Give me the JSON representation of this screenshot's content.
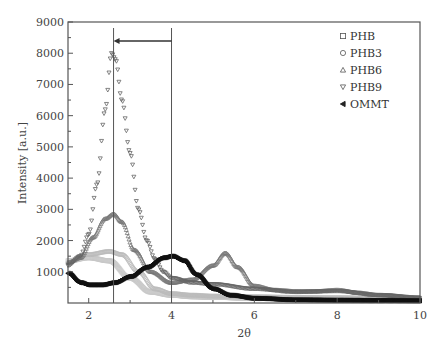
{
  "chart_data": {
    "type": "scatter",
    "title": "",
    "xlabel": "2θ",
    "ylabel": "Intensity [a.u.]",
    "xlim": [
      1.5,
      10
    ],
    "ylim": [
      0,
      9000
    ],
    "xticks": [
      2,
      4,
      6,
      8,
      10
    ],
    "yticks": [
      1000,
      2000,
      3000,
      4000,
      5000,
      6000,
      7000,
      8000,
      9000
    ],
    "grid": false,
    "legend_position": "top-right",
    "annotations": {
      "vertical_lines_x": [
        2.6,
        4.0
      ],
      "arrow": {
        "from_x": 4.0,
        "to_x": 2.6,
        "y": 8400
      }
    },
    "series": [
      {
        "name": "PHB",
        "marker": "square",
        "color": "#c8c8c8",
        "x": [
          1.5,
          2.0,
          2.5,
          3.0,
          3.5,
          4.0,
          4.5,
          5.0,
          6.0,
          7.0,
          8.0,
          9.0,
          10.0
        ],
        "y": [
          1350,
          1450,
          1350,
          800,
          350,
          250,
          200,
          180,
          150,
          130,
          120,
          110,
          100
        ]
      },
      {
        "name": "PHB3",
        "marker": "circle",
        "color": "#bbbbbb",
        "x": [
          1.5,
          2.0,
          2.5,
          2.8,
          3.2,
          3.6,
          4.0,
          4.5,
          5.0,
          6.0,
          7.0,
          8.0,
          9.0,
          10.0
        ],
        "y": [
          1300,
          1550,
          1650,
          1550,
          1000,
          450,
          300,
          250,
          220,
          200,
          180,
          170,
          150,
          130
        ]
      },
      {
        "name": "PHB6",
        "marker": "triangle-up",
        "color": "#777777",
        "x": [
          1.5,
          1.8,
          2.1,
          2.4,
          2.6,
          2.8,
          3.1,
          3.5,
          4.0,
          4.5,
          5.0,
          5.3,
          5.6,
          6.0,
          6.5,
          7.0,
          7.5,
          8.0,
          8.5,
          9.0,
          10.0
        ],
        "y": [
          1300,
          1450,
          2100,
          2700,
          2850,
          2600,
          1700,
          1000,
          650,
          750,
          1200,
          1600,
          1150,
          550,
          420,
          380,
          380,
          420,
          330,
          260,
          180
        ]
      },
      {
        "name": "PHB9",
        "marker": "triangle-down",
        "color": "#666666",
        "x": [
          1.5,
          1.8,
          2.0,
          2.2,
          2.4,
          2.55,
          2.65,
          2.8,
          3.0,
          3.2,
          3.4,
          3.6,
          3.8,
          4.0,
          4.5,
          5.0,
          6.0,
          7.0,
          8.0,
          9.0,
          10.0
        ],
        "y": [
          1200,
          1500,
          2200,
          3800,
          6200,
          8000,
          7800,
          6500,
          4800,
          3000,
          2000,
          1400,
          1000,
          800,
          650,
          600,
          450,
          350,
          380,
          250,
          160
        ]
      },
      {
        "name": "OMMT",
        "marker": "triangle-left",
        "color": "#111111",
        "x": [
          1.5,
          1.8,
          2.0,
          2.3,
          2.6,
          3.0,
          3.4,
          3.8,
          4.0,
          4.3,
          4.6,
          5.0,
          5.4,
          6.0,
          7.0,
          8.0,
          9.0,
          10.0
        ],
        "y": [
          950,
          650,
          580,
          580,
          650,
          850,
          1150,
          1450,
          1500,
          1350,
          900,
          450,
          250,
          150,
          100,
          90,
          80,
          70
        ]
      }
    ]
  }
}
